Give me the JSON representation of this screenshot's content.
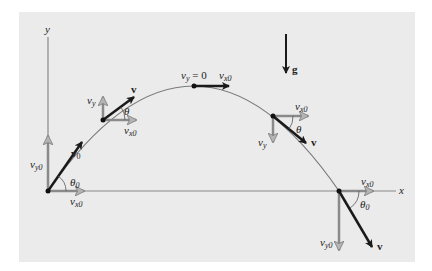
{
  "diagram": {
    "colors": {
      "panel": "#ebebeb",
      "trajectory": "#7a7a7a",
      "velocity": "#1a1a1a",
      "component": "#8a8a8a",
      "text": "#222222"
    },
    "axes": {
      "x_label": "x",
      "y_label": "y"
    },
    "gravity": {
      "label": "g"
    },
    "points": [
      {
        "name": "launch",
        "labels": {
          "v": "v",
          "v_sub": "0",
          "vx": "v",
          "vx_sub": "x0",
          "vy": "v",
          "vy_sub": "y0",
          "theta": "θ",
          "theta_sub": "0"
        }
      },
      {
        "name": "rising",
        "labels": {
          "v": "v",
          "vx": "v",
          "vx_sub": "x0",
          "vy": "v",
          "vy_sub": "y",
          "theta": "θ"
        }
      },
      {
        "name": "apex",
        "labels": {
          "vy": "v",
          "vy_sub": "y",
          "vy_eq": " = 0",
          "vx": "v",
          "vx_sub": "x0"
        }
      },
      {
        "name": "descending",
        "labels": {
          "v": "v",
          "vx": "v",
          "vx_sub": "x0",
          "vy": "v",
          "vy_sub": "y",
          "theta": "θ"
        }
      },
      {
        "name": "landing",
        "labels": {
          "v": "v",
          "vx": "v",
          "vx_sub": "x0",
          "vy": "v",
          "vy_sub": "y0",
          "theta": "θ",
          "theta_sub": "0"
        }
      }
    ]
  }
}
